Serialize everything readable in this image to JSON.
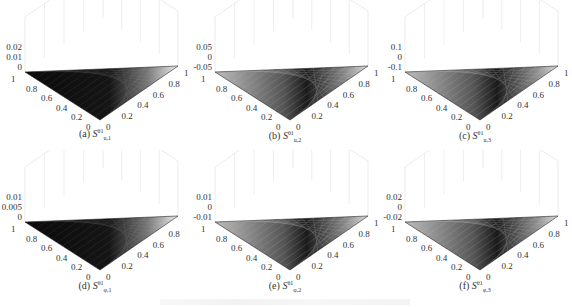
{
  "chart_data": [
    {
      "id": "a",
      "type": "surface3d",
      "caption": {
        "label": "(a)",
        "symbol": "S",
        "sup": "θ1",
        "sub": "u,1"
      },
      "zticks": [
        "0.02",
        "0.01",
        "0"
      ],
      "xticks": [
        "1",
        "0.8",
        "0.6",
        "0.4",
        "0.2",
        "0"
      ],
      "yticks": [
        "0",
        "0.2",
        "0.4",
        "0.6",
        "0.8",
        "1"
      ],
      "xlim": [
        0,
        1
      ],
      "ylim": [
        0,
        1
      ],
      "zlim": [
        0,
        0.02
      ],
      "domain": "triangle",
      "shading": "dark"
    },
    {
      "id": "b",
      "type": "surface3d",
      "caption": {
        "label": "(b)",
        "symbol": "S",
        "sup": "θ1",
        "sub": "u,2"
      },
      "zticks": [
        "0.05",
        "0",
        "-0.05"
      ],
      "xticks": [
        "1",
        "0.8",
        "0.6",
        "0.4",
        "0.2",
        "0"
      ],
      "yticks": [
        "0",
        "0.2",
        "0.4",
        "0.6",
        "0.8",
        "1"
      ],
      "xlim": [
        0,
        1
      ],
      "ylim": [
        0,
        1
      ],
      "zlim": [
        -0.05,
        0.05
      ],
      "domain": "triangle",
      "shading": "mesh"
    },
    {
      "id": "c",
      "type": "surface3d",
      "caption": {
        "label": "(c)",
        "symbol": "S",
        "sup": "θ1",
        "sub": "u,3"
      },
      "zticks": [
        "0.1",
        "0",
        "-0.1"
      ],
      "xticks": [
        "1",
        "0.8",
        "0.6",
        "0.4",
        "0.2",
        "0"
      ],
      "yticks": [
        "0",
        "0.2",
        "0.4",
        "0.6",
        "0.8",
        "1"
      ],
      "xlim": [
        0,
        1
      ],
      "ylim": [
        0,
        1
      ],
      "zlim": [
        -0.1,
        0.1
      ],
      "domain": "triangle",
      "shading": "mesh"
    },
    {
      "id": "d",
      "type": "surface3d",
      "caption": {
        "label": "(d)",
        "symbol": "S",
        "sup": "θ1",
        "sub": "φ,1"
      },
      "zticks": [
        "0.01",
        "0.005",
        "0"
      ],
      "xticks": [
        "1",
        "0.8",
        "0.6",
        "0.4",
        "0.2",
        "0"
      ],
      "yticks": [
        "0",
        "0.2",
        "0.4",
        "0.6",
        "0.8"
      ],
      "xlim": [
        0,
        1
      ],
      "ylim": [
        0,
        1
      ],
      "zlim": [
        0,
        0.01
      ],
      "domain": "triangle",
      "shading": "dark"
    },
    {
      "id": "e",
      "type": "surface3d",
      "caption": {
        "label": "(e)",
        "symbol": "S",
        "sup": "θ1",
        "sub": "φ,2"
      },
      "zticks": [
        "0.01",
        "0",
        "-0.01"
      ],
      "xticks": [
        "1",
        "0.8",
        "0.6",
        "0.4",
        "0.2",
        "0"
      ],
      "yticks": [
        "0",
        "0.2",
        "0.4",
        "0.6",
        "0.8",
        "1"
      ],
      "xlim": [
        0,
        1
      ],
      "ylim": [
        0,
        1
      ],
      "zlim": [
        -0.01,
        0.01
      ],
      "domain": "triangle",
      "shading": "mesh"
    },
    {
      "id": "f",
      "type": "surface3d",
      "caption": {
        "label": "(f)",
        "symbol": "S",
        "sup": "θ1",
        "sub": "φ,3"
      },
      "zticks": [
        "0.02",
        "0",
        "-0.02"
      ],
      "xticks": [
        "1",
        "0.8",
        "0.6",
        "0.4",
        "0.2",
        "0"
      ],
      "yticks": [
        "0",
        "0.2",
        "0.4",
        "0.6",
        "0.8",
        "1"
      ],
      "xlim": [
        0,
        1
      ],
      "ylim": [
        0,
        1
      ],
      "zlim": [
        -0.02,
        0.02
      ],
      "domain": "triangle",
      "shading": "mesh"
    }
  ],
  "colors": {
    "surface_dark": "#111111",
    "surface_mid": "#5a5a5a",
    "mesh_line": "#bbbbbb",
    "box_line": "#dddddd",
    "text": "#333333"
  }
}
